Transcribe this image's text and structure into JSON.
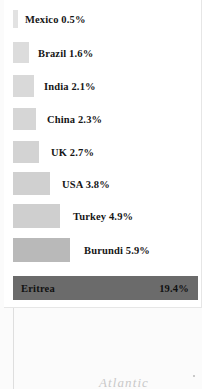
{
  "map": {
    "ocean_label": "Atlantic",
    "marker_name": "map-dot-marker"
  },
  "legend": {
    "entries": [
      {
        "name": "Mexico",
        "value": "0.5%",
        "label": "Mexico 0.5%",
        "bar_width": 5,
        "bar_height": 18,
        "color": "#e2e2e2",
        "top": 12,
        "label_x": 21
      },
      {
        "name": "Brazil",
        "value": "1.6%",
        "label": "Brazil 1.6%",
        "bar_width": 16,
        "bar_height": 21,
        "color": "#dcdcdc",
        "top": 44,
        "label_x": 34
      },
      {
        "name": "India",
        "value": "2.1%",
        "label": "India 2.1%",
        "bar_width": 21,
        "bar_height": 22,
        "color": "#d9d9d9",
        "top": 77,
        "label_x": 40
      },
      {
        "name": "China",
        "value": "2.3%",
        "label": "China 2.3%",
        "bar_width": 23,
        "bar_height": 22,
        "color": "#d6d6d6",
        "top": 110,
        "label_x": 43
      },
      {
        "name": "UK",
        "value": "2.7%",
        "label": "UK 2.7%",
        "bar_width": 26,
        "bar_height": 22,
        "color": "#d3d3d3",
        "top": 143,
        "label_x": 47
      },
      {
        "name": "USA",
        "value": "3.8%",
        "label": "USA 3.8%",
        "bar_width": 37,
        "bar_height": 23,
        "color": "#d0d0d0",
        "top": 174,
        "label_x": 58
      },
      {
        "name": "Turkey",
        "value": "4.9%",
        "label": "Turkey 4.9%",
        "bar_width": 47,
        "bar_height": 24,
        "color": "#cfcfcf",
        "top": 206,
        "label_x": 69
      },
      {
        "name": "Burundi",
        "value": "5.9%",
        "label": "Burundi 5.9%",
        "bar_width": 57,
        "bar_height": 24,
        "color": "#b9b9b9",
        "top": 240,
        "label_x": 80
      }
    ],
    "highlight": {
      "name": "Eritrea",
      "value": "19.4%",
      "color": "#6b6b6b"
    }
  },
  "chart_data": {
    "type": "bar",
    "title": "",
    "xlabel": "",
    "ylabel": "",
    "categories": [
      "Mexico",
      "Brazil",
      "India",
      "China",
      "UK",
      "USA",
      "Turkey",
      "Burundi",
      "Eritrea"
    ],
    "values": [
      0.5,
      1.6,
      2.1,
      2.3,
      2.7,
      3.8,
      4.9,
      5.9,
      19.4
    ],
    "value_labels": [
      "0.5%",
      "1.6%",
      "2.1%",
      "2.3%",
      "2.7%",
      "3.8%",
      "4.9%",
      "5.9%",
      "19.4%"
    ],
    "unit": "%",
    "orientation": "horizontal",
    "xlim": [
      0,
      19.4
    ],
    "grid": false,
    "legend_position": "none",
    "highlight_category": "Eritrea"
  }
}
